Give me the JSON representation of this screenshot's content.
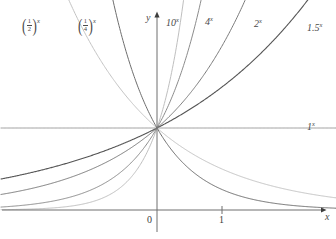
{
  "figure": {
    "kind": "math-graph",
    "background_color": "#ffffff"
  },
  "axes": {
    "x_axis_label": "x",
    "y_axis_label": "y",
    "origin_label": "0",
    "x_ticks": [
      {
        "label": "1",
        "value": 1
      }
    ],
    "x_range": [
      -2.4,
      2.75
    ],
    "y_range": [
      -0.28,
      4.15
    ],
    "grid": false,
    "axis_color": "#6e6e6e",
    "origin_px": {
      "x": 157,
      "y": 210
    },
    "unit_px": {
      "x": 65,
      "y": 82
    }
  },
  "curve_labels": {
    "half": {
      "base_num": "1",
      "base_den": "2",
      "exponent": "x"
    },
    "quarter": {
      "base_num": "1",
      "base_den": "4",
      "exponent": "x"
    },
    "ten": {
      "base": "10",
      "exponent": "x"
    },
    "four": {
      "base": "4",
      "exponent": "x"
    },
    "two": {
      "base": "2",
      "exponent": "x"
    },
    "one_point_five": {
      "base": "1.5",
      "exponent": "x"
    },
    "one": {
      "base": "1",
      "exponent": "x"
    }
  },
  "chart_data": {
    "type": "line",
    "title": "",
    "subtitle": "",
    "xlabel": "x",
    "ylabel": "y",
    "xlim": [
      -2.4,
      2.75
    ],
    "ylim": [
      -0.28,
      4.15
    ],
    "grid": false,
    "legend": "inline-curve-labels",
    "common_point": {
      "x": 0,
      "y": 1
    },
    "annotations": [
      {
        "text": "(1/2)^x",
        "x": -1.9,
        "y": 4.0
      },
      {
        "text": "(1/4)^x",
        "x": -1.1,
        "y": 4.0
      },
      {
        "text": "10^x",
        "x": 0.25,
        "y": 4.0
      },
      {
        "text": "4^x",
        "x": 0.95,
        "y": 4.0
      },
      {
        "text": "2^x",
        "x": 1.7,
        "y": 3.95
      },
      {
        "text": "1.5^x",
        "x": 2.45,
        "y": 3.82
      },
      {
        "text": "1^x",
        "x": 2.45,
        "y": 1.0
      },
      {
        "text": "0",
        "x": -0.08,
        "y": -0.18
      },
      {
        "text": "1",
        "x": 1.0,
        "y": -0.18
      },
      {
        "text": "x",
        "x": 2.68,
        "y": -0.2
      },
      {
        "text": "y",
        "x": -0.12,
        "y": 4.12
      }
    ],
    "series": [
      {
        "name": "10^x",
        "base": 10,
        "color": "#bfbfbf",
        "width": 1.0,
        "x": [
          -2.4,
          -2.2,
          -2.0,
          -1.8,
          -1.6,
          -1.4,
          -1.2,
          -1.0,
          -0.8,
          -0.6,
          -0.4,
          -0.2,
          0.0,
          0.1,
          0.2,
          0.3,
          0.4,
          0.5,
          0.6
        ],
        "values": [
          0.004,
          0.006,
          0.01,
          0.016,
          0.025,
          0.04,
          0.063,
          0.1,
          0.158,
          0.251,
          0.398,
          0.631,
          1.0,
          1.259,
          1.585,
          1.995,
          2.512,
          3.162,
          3.981
        ]
      },
      {
        "name": "4^x",
        "base": 4,
        "color": "#8c8c8c",
        "width": 1.0,
        "x": [
          -2.4,
          -2.2,
          -2.0,
          -1.8,
          -1.6,
          -1.4,
          -1.2,
          -1.0,
          -0.8,
          -0.6,
          -0.4,
          -0.2,
          0.0,
          0.2,
          0.4,
          0.6,
          0.8,
          1.0
        ],
        "values": [
          0.033,
          0.043,
          0.063,
          0.082,
          0.109,
          0.144,
          0.19,
          0.25,
          0.33,
          0.435,
          0.574,
          0.758,
          1.0,
          1.32,
          1.741,
          2.297,
          3.031,
          4.0
        ]
      },
      {
        "name": "2^x",
        "base": 2,
        "color": "#7a7a7a",
        "width": 1.0,
        "x": [
          -2.4,
          -2.0,
          -1.6,
          -1.2,
          -0.8,
          -0.4,
          0.0,
          0.4,
          0.8,
          1.2,
          1.6,
          2.0
        ],
        "values": [
          0.189,
          0.25,
          0.33,
          0.435,
          0.574,
          0.758,
          1.0,
          1.32,
          1.741,
          2.297,
          3.031,
          4.0
        ]
      },
      {
        "name": "1.5^x",
        "base": 1.5,
        "color": "#555555",
        "width": 1.1,
        "x": [
          -2.4,
          -2.0,
          -1.6,
          -1.2,
          -0.8,
          -0.4,
          0.0,
          0.4,
          0.8,
          1.2,
          1.6,
          2.0,
          2.4,
          2.75
        ],
        "values": [
          0.363,
          0.444,
          0.544,
          0.667,
          0.816,
          1.0,
          1.0,
          1.177,
          1.386,
          1.631,
          1.92,
          2.25,
          2.649,
          3.05
        ]
      },
      {
        "name": "1^x",
        "base": 1,
        "color": "#9a9a9a",
        "width": 1.0,
        "x": [
          -2.4,
          2.75
        ],
        "values": [
          1.0,
          1.0
        ]
      },
      {
        "name": "(1/2)^x",
        "base": 0.5,
        "color": "#c4c4c4",
        "width": 1.0,
        "x": [
          -2.0,
          -1.6,
          -1.2,
          -0.8,
          -0.4,
          0.0,
          0.4,
          0.8,
          1.2,
          1.6,
          2.0,
          2.4,
          2.75
        ],
        "values": [
          4.0,
          3.031,
          2.297,
          1.741,
          1.32,
          1.0,
          0.758,
          0.574,
          0.435,
          0.33,
          0.25,
          0.189,
          0.149
        ]
      },
      {
        "name": "(1/4)^x",
        "base": 0.25,
        "color": "#6e6e6e",
        "width": 1.0,
        "x": [
          -1.0,
          -0.8,
          -0.6,
          -0.4,
          -0.2,
          0.0,
          0.4,
          0.8,
          1.2,
          1.6,
          2.0,
          2.4,
          2.75
        ],
        "values": [
          4.0,
          3.031,
          2.297,
          1.741,
          1.32,
          1.0,
          0.574,
          0.33,
          0.19,
          0.109,
          0.063,
          0.036,
          0.023
        ]
      }
    ]
  }
}
